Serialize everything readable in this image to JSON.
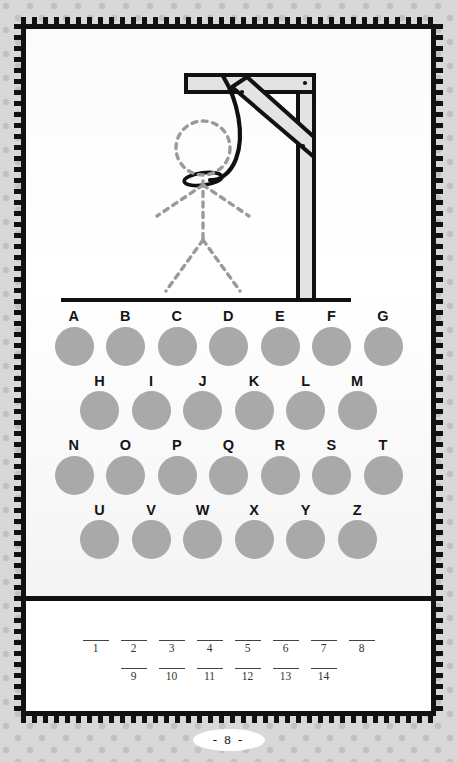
{
  "page": {
    "page_number_label": "- 8 -",
    "background_color": "#d8d8d8",
    "dot_color": "#c2c2c2",
    "frame_color": "#111111",
    "card_color": "#ffffff"
  },
  "gallows": {
    "name": "hangman-gallows",
    "beam_fill": "#e3e3e3",
    "beam_stroke": "#111111",
    "rope_color": "#111111",
    "figure_color": "#9a9a9a",
    "figure_style": "dashed",
    "parts_drawn": [
      "head",
      "body",
      "left-arm",
      "right-arm",
      "left-leg",
      "right-leg"
    ]
  },
  "alphabet": {
    "dot_color": "#a9a9a9",
    "rows": [
      {
        "letters": [
          "A",
          "B",
          "C",
          "D",
          "E",
          "F",
          "G"
        ]
      },
      {
        "letters": [
          "H",
          "I",
          "J",
          "K",
          "L",
          "M"
        ]
      },
      {
        "letters": [
          "N",
          "O",
          "P",
          "Q",
          "R",
          "S",
          "T"
        ]
      },
      {
        "letters": [
          "U",
          "V",
          "W",
          "X",
          "Y",
          "Z"
        ]
      }
    ]
  },
  "answer": {
    "rows": [
      {
        "numbers": [
          "1",
          "2",
          "3",
          "4",
          "5",
          "6",
          "7",
          "8"
        ]
      },
      {
        "numbers": [
          "9",
          "10",
          "11",
          "12",
          "13",
          "14"
        ]
      }
    ]
  }
}
